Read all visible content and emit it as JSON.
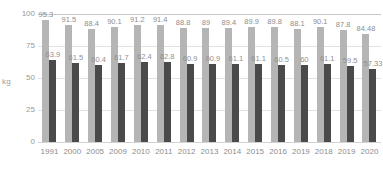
{
  "chart_data": {
    "type": "bar",
    "title": "",
    "subtitle": "",
    "xlabel": "",
    "ylabel": "kg",
    "ylim": [
      0,
      100
    ],
    "yticks": [
      100,
      75,
      50,
      25,
      0
    ],
    "grid": true,
    "legend": "none",
    "orientation": "vertical",
    "grouping": "grouped",
    "categories": [
      "1991",
      "2000",
      "2005",
      "2009",
      "2010",
      "2011",
      "2012",
      "2013",
      "2014",
      "2015",
      "2016",
      "2019",
      "2018",
      "2019",
      "2020"
    ],
    "series": [
      {
        "name": "light-series",
        "color": "#b5b5b5",
        "values": [
          95.3,
          91.5,
          88.4,
          90.1,
          91.2,
          91.4,
          88.8,
          89,
          89.4,
          89.9,
          89.8,
          88.1,
          90.1,
          87.8,
          84.48
        ],
        "labels": [
          "95.3",
          "91.5",
          "88.4",
          "90.1",
          "91.2",
          "91.4",
          "88.8",
          "89",
          "89.4",
          "89.9",
          "89.8",
          "88.1",
          "90.1",
          "87.8",
          "84.48"
        ]
      },
      {
        "name": "dark-series",
        "color": "#4a4a4a",
        "values": [
          63.9,
          61.5,
          60.4,
          61.7,
          62.4,
          62.8,
          60.9,
          60.9,
          61.1,
          61.1,
          60.5,
          60,
          61.1,
          59.5,
          57.33
        ],
        "labels": [
          "63.9",
          "61.5",
          "60.4",
          "61.7",
          "62.4",
          "62.8",
          "60.9",
          "60.9",
          "61.1",
          "61.1",
          "60.5",
          "60",
          "61.1",
          "59.5",
          "57.33"
        ]
      }
    ]
  },
  "colors": {
    "background": "#ffffff",
    "light_bar": "#b5b5b5",
    "dark_bar": "#4a4a4a",
    "gridline": "#e2e2e2",
    "axis_text": "#8d8d8d"
  }
}
